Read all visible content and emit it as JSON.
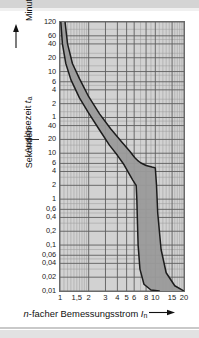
{
  "chart_data": {
    "type": "line",
    "title": "",
    "xlabel": "n-facher Bemessungsstrom I_n",
    "ylabel": "Auslösezeit t_a",
    "grid": true,
    "legend": null,
    "x_scale": "log",
    "y_scale": "log",
    "xlim": [
      1,
      20
    ],
    "x_ticks": [
      "1",
      "1,5",
      "2",
      "3",
      "4",
      "5",
      "6",
      "8",
      "10",
      "15",
      "20"
    ],
    "x_tick_values": [
      1,
      1.5,
      2,
      3,
      4,
      5,
      6,
      8,
      10,
      15,
      20
    ],
    "y_sections": [
      {
        "unit": "Minuten",
        "ticks": [
          "120",
          "60",
          "40",
          "20",
          "10",
          "6",
          "4",
          "2",
          "1"
        ],
        "tick_values_seconds": [
          7200,
          3600,
          2400,
          1200,
          600,
          360,
          240,
          120,
          60
        ]
      },
      {
        "unit": "Sekunden",
        "ticks": [
          "40",
          "20",
          "10",
          "6",
          "4",
          "2",
          "1",
          "0,6",
          "0,4",
          "0,2",
          "0,1",
          "0,06",
          "0,04",
          "0,02",
          "0,01"
        ],
        "tick_values_seconds": [
          40,
          20,
          10,
          6,
          4,
          2,
          1,
          0.6,
          0.4,
          0.2,
          0.1,
          0.06,
          0.04,
          0.02,
          0.01
        ]
      }
    ],
    "ylim_seconds": [
      0.01,
      7200
    ],
    "band_label": "G",
    "annotation": "G",
    "series": [
      {
        "name": "obere Grenzkurve",
        "note": "upper tripping-time boundary",
        "points_x": [
          1.13,
          1.2,
          1.35,
          1.6,
          2.0,
          2.6,
          3.4,
          4.4,
          5.4,
          6.1,
          6.5,
          7.0,
          8.0,
          9.2,
          10.0,
          10.3,
          10.6,
          11.5,
          13.0,
          16.0,
          20.0
        ],
        "points_y_seconds": [
          7200,
          2400,
          900,
          420,
          170,
          72,
          34,
          18,
          11,
          8.0,
          7.0,
          6.2,
          5.4,
          5.0,
          4.8,
          2.0,
          0.5,
          0.08,
          0.025,
          0.013,
          0.01
        ]
      },
      {
        "name": "untere Grenzkurve",
        "note": "lower tripping-time boundary",
        "points_x": [
          1.02,
          1.06,
          1.15,
          1.3,
          1.6,
          2.0,
          2.6,
          3.3,
          4.0,
          4.7,
          5.3,
          5.8,
          6.1,
          6.3,
          6.4,
          6.5,
          6.6,
          6.9,
          7.6,
          9.0,
          11.0
        ],
        "points_y_seconds": [
          7200,
          2400,
          900,
          400,
          160,
          75,
          32,
          15,
          9.0,
          5.6,
          3.6,
          2.6,
          2.2,
          2.0,
          1.0,
          0.3,
          0.1,
          0.03,
          0.014,
          0.0105,
          0.01
        ]
      }
    ],
    "band_fill_color": "#9a9a9a",
    "plot_bg_color": "#d2d2d2",
    "grid_color": "#6d6d6d",
    "curve_color": "#1c1c1c"
  },
  "axes": {
    "y_title_main": "Auslösezeit",
    "y_title_symbol": "t",
    "y_title_sub": "a",
    "y_unit_upper": "Minuten",
    "y_unit_lower": "Sekunden",
    "x_title_prefix": "n",
    "x_title_main": "-facher Bemessungsstrom",
    "x_title_symbol": "I",
    "x_title_sub": "n"
  },
  "marks": {
    "band_letter": "G"
  }
}
